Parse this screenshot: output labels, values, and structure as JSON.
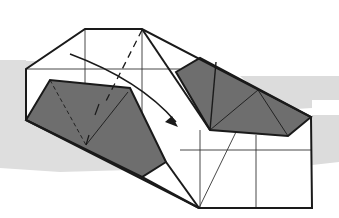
{
  "diagram": {
    "type": "origami-fold-step",
    "colors": {
      "background": "#ffffff",
      "band": "#d9d9d9",
      "paper_white": "#ffffff",
      "paper_colored": "#6b6b6b",
      "line": "#1a1a1a"
    },
    "arrow": {
      "meaning": "fold direction",
      "style": "curved"
    },
    "fold_lines": {
      "valley_fold": "dashed"
    }
  }
}
